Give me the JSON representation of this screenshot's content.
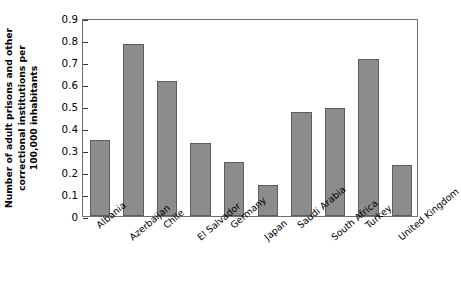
{
  "chart_data": {
    "type": "bar",
    "title": "",
    "subtitle": "",
    "xlabel": "",
    "ylabel": "Number of adult prisons and other correctional institutions per 100,000 inhabitants",
    "ylabel_lines": [
      "Number of adult prisons and other",
      "correctional institutions per",
      "100,000 inhabitants"
    ],
    "categories": [
      "Albania",
      "Azerbaijan",
      "Chile",
      "El Salvador",
      "Germany",
      "Japan",
      "Saudi Arabia",
      "South Africa",
      "Turkey",
      "United Kingdom"
    ],
    "values": [
      0.345,
      0.78,
      0.615,
      0.33,
      0.245,
      0.14,
      0.475,
      0.49,
      0.715,
      0.23
    ],
    "ylim": [
      0,
      0.9
    ],
    "yticks": [
      0,
      0.1,
      0.2,
      0.3,
      0.4,
      0.5,
      0.6,
      0.7,
      0.8,
      0.9
    ],
    "ytick_labels": [
      "0",
      "0.1",
      "0.2",
      "0.3",
      "0.4",
      "0.5",
      "0.6",
      "0.7",
      "0.8",
      "0.9"
    ],
    "grid": false,
    "legend": null,
    "legend_position": "none",
    "bar_color": "#8c8c8c",
    "bar_edge_color": "#5d5d5d",
    "frame_color": "#6f6f6f",
    "text_color": "#000000"
  }
}
